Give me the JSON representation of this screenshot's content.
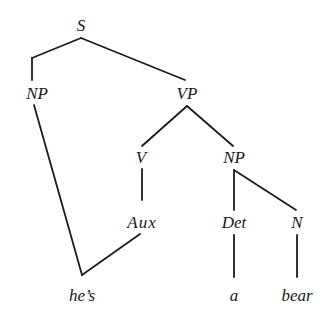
{
  "diagram": {
    "type": "syntax-tree",
    "nodes": {
      "s": "S",
      "np_subject": "NP",
      "vp": "VP",
      "v": "V",
      "np_object": "NP",
      "aux": "Aux",
      "det": "Det",
      "n": "N",
      "word_hes": "he’s",
      "word_a": "a",
      "word_bear": "bear"
    },
    "edges": [
      [
        "S",
        "NP"
      ],
      [
        "S",
        "VP"
      ],
      [
        "VP",
        "V"
      ],
      [
        "VP",
        "NP"
      ],
      [
        "V",
        "Aux"
      ],
      [
        "NP(object)",
        "Det"
      ],
      [
        "NP(object)",
        "N"
      ],
      [
        "NP(subject)",
        "he’s"
      ],
      [
        "Aux",
        "he’s"
      ],
      [
        "Det",
        "a"
      ],
      [
        "N",
        "bear"
      ]
    ],
    "colors": {
      "line": "#1c1c1c",
      "text": "#1a1a1a",
      "background": "#ffffff"
    }
  }
}
